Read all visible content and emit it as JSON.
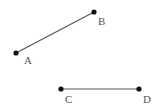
{
  "diagram": {
    "segments": [
      {
        "name": "AB",
        "from": "A",
        "to": "B"
      },
      {
        "name": "CD",
        "from": "C",
        "to": "D"
      }
    ],
    "points": [
      {
        "label": "A",
        "x": 16,
        "y": 53,
        "lx": 24,
        "ly": 64
      },
      {
        "label": "B",
        "x": 94,
        "y": 12,
        "lx": 98,
        "ly": 25
      },
      {
        "label": "C",
        "x": 61,
        "y": 89,
        "lx": 65,
        "ly": 103
      },
      {
        "label": "D",
        "x": 139,
        "y": 89,
        "lx": 143,
        "ly": 103
      }
    ],
    "colors": {
      "line": "#555555",
      "point": "#111111",
      "label": "#555555"
    }
  }
}
